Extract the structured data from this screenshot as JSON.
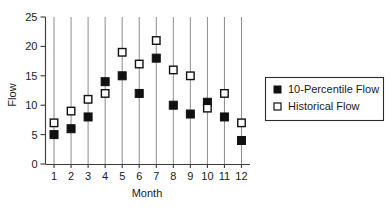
{
  "chart_data": {
    "type": "scatter",
    "title": "",
    "xlabel": "Month",
    "ylabel": "Flow",
    "xlim": [
      0.4,
      12.6
    ],
    "ylim": [
      0,
      25
    ],
    "yticks": [
      0,
      5,
      10,
      15,
      20,
      25
    ],
    "xticks": [
      1,
      2,
      3,
      4,
      5,
      6,
      7,
      8,
      9,
      10,
      11,
      12
    ],
    "grid": "vertical",
    "legend_position": "right",
    "categories": [
      "1",
      "2",
      "3",
      "4",
      "5",
      "6",
      "7",
      "8",
      "9",
      "10",
      "11",
      "12"
    ],
    "x": [
      1,
      2,
      3,
      4,
      5,
      6,
      7,
      8,
      9,
      10,
      11,
      12
    ],
    "series": [
      {
        "name": "10-Percentile Flow",
        "marker": "filled-square",
        "color": "#111111",
        "values": [
          5,
          6,
          8,
          14,
          15,
          12,
          18,
          10,
          8.5,
          10.5,
          8,
          4
        ]
      },
      {
        "name": "Historical Flow",
        "marker": "open-square",
        "color": "#ffffff",
        "edge_color": "#111111",
        "values": [
          7,
          9,
          11,
          12,
          19,
          17,
          21,
          16,
          15,
          9.5,
          12,
          7
        ]
      }
    ]
  },
  "axes": {
    "y_tick_labels": [
      "0",
      "5",
      "10",
      "15",
      "20",
      "25"
    ],
    "x_tick_labels": [
      "1",
      "2",
      "3",
      "4",
      "5",
      "6",
      "7",
      "8",
      "9",
      "10",
      "11",
      "12"
    ],
    "x_axis_title": "Month",
    "y_axis_title": "Flow"
  },
  "legend": {
    "entries": [
      {
        "label": "10-Percentile Flow",
        "marker": "filled-square"
      },
      {
        "label": "Historical Flow",
        "marker": "open-square"
      }
    ]
  },
  "colors": {
    "marker_dark": "#111111",
    "marker_open_fill": "#ffffff",
    "gridline": "#8c8c8c",
    "axis": "#3a3a3a",
    "text": "#1a1a1a",
    "background": "#ffffff"
  }
}
